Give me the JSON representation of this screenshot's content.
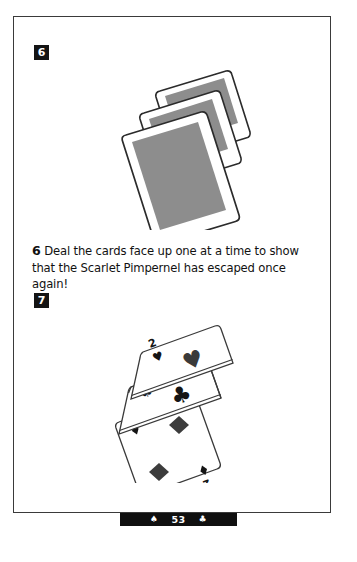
{
  "page": {
    "background_color": "#ffffff",
    "frame_color": "#3a3a3a"
  },
  "steps": [
    {
      "number": "6",
      "badge_name": "step-badge-6",
      "illustration": {
        "name": "face-down-card-stack",
        "description": "Three face-down playing cards fanned in a tilted stack, gray backs with white borders",
        "card_back_color": "#8d8d8d",
        "card_face_color": "#ffffff",
        "outline_color": "#2b2b2b",
        "card_count": 3
      },
      "caption": {
        "lead_number": "6",
        "text": "Deal the cards face up one at a time to show that the Scarlet Pimpernel has escaped once again!"
      }
    },
    {
      "number": "7",
      "badge_name": "step-badge-7",
      "illustration": {
        "name": "dealt-twos-spread",
        "description": "Three face-up playing cards spread in a tilted column, all rank 2",
        "outline_color": "#2b2b2b",
        "pip_color": "#111111",
        "cards": [
          {
            "rank": "2",
            "suit": "hearts",
            "suit_symbol": "♥",
            "position": "top"
          },
          {
            "rank": "2",
            "suit": "clubs",
            "suit_symbol": "♣",
            "position": "middle"
          },
          {
            "rank": "2",
            "suit": "diamonds",
            "suit_symbol": "♦",
            "position": "bottom"
          }
        ]
      }
    }
  ],
  "footer": {
    "left_pip": "♠",
    "page_number": "53",
    "right_pip": "♣",
    "plate_color": "#101010",
    "text_color": "#ffffff"
  }
}
